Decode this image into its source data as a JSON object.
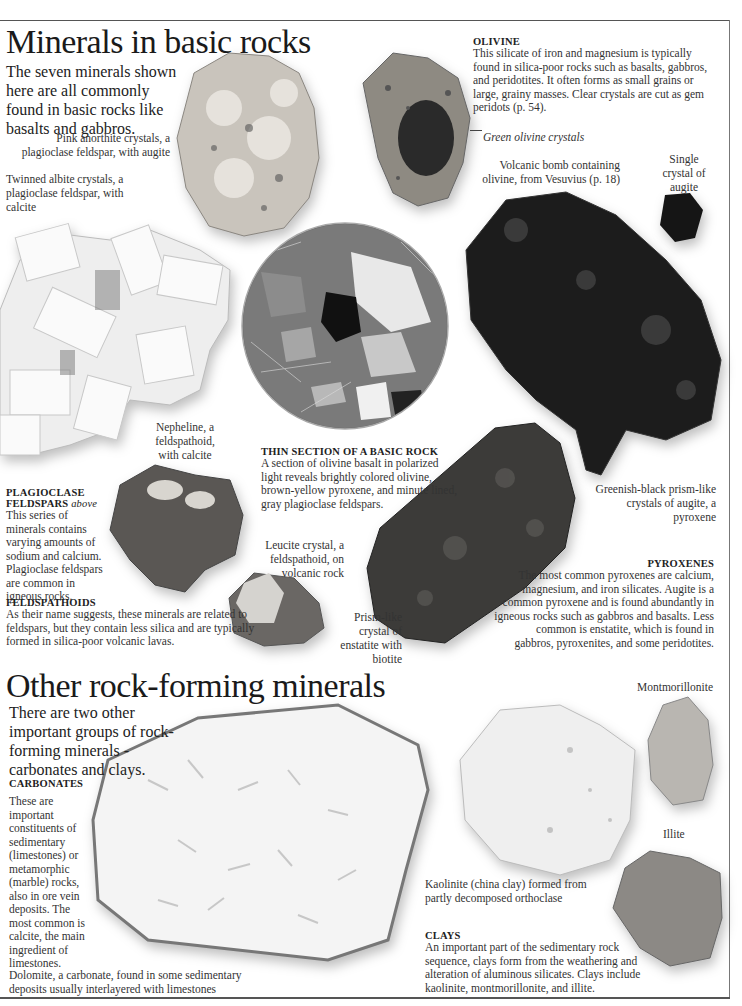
{
  "section1": {
    "title": "Minerals in basic rocks",
    "intro": "The seven minerals shown here are all commonly found in basic rocks like basalts and gabbros."
  },
  "captions": {
    "anorthite": "Pink anorthite crystals, a plagioclase feldspar, with augite",
    "albite": "Twinned albite crystals, a plagioclase feldspar, with calcite",
    "olivine_crystals": "Green olivine crystals",
    "volcanic_bomb": "Volcanic bomb containing olivine, from Vesuvius (p. 18)",
    "single_augite": "Single crystal of augite",
    "nepheline": "Nepheline, a feldspathoid, with calcite",
    "leucite": "Leucite crystal, a feldspathoid, on volcanic rock",
    "enstatite": "Prism-like crystal of enstatite with biotite",
    "augite_prisms": "Greenish-black prism-like crystals of augite, a pyroxene",
    "montmorillonite": "Montmorillonite",
    "illite": "Illite",
    "kaolinite": "Kaolinite (china clay) formed from partly decomposed orthoclase",
    "dolomite": "Dolomite, a carbonate, found in some sedimentary deposits usually interlayered with limestones"
  },
  "boxes": {
    "olivine": {
      "heading": "OLIVINE",
      "text": "This silicate of iron and magnesium is typically found in silica-poor rocks such as basalts, gabbros, and peridotites. It often forms as small grains or large, grainy masses. Clear crystals are cut as gem peridots (p. 54)."
    },
    "plagioclase": {
      "heading": "PLAGIOCLASE FELDSPARS",
      "heading_suffix": "above",
      "text": "This series of minerals contains varying amounts of sodium and calcium. Plagioclase feldspars are common in igneous rocks."
    },
    "thin_section": {
      "heading": "THIN SECTION OF A BASIC ROCK",
      "text": "A section of olivine basalt in polarized light reveals brightly colored olivine, brown-yellow pyroxene, and minute lined, gray plagioclase feldspars."
    },
    "feldspathoids": {
      "heading": "FELDSPATHOIDS",
      "text": "As their name suggests, these minerals are related to feldspars, but they contain less silica and are typically formed in silica-poor volcanic lavas."
    },
    "pyroxenes": {
      "heading": "PYROXENES",
      "text": "The most common pyroxenes are calcium, magnesium, and iron silicates. Augite is a common pyroxene and is found abundantly in igneous rocks such as gabbros and basalts. Less common is enstatite, which is found in gabbros, pyroxenites, and some peridotites."
    },
    "carbonates": {
      "heading": "CARBONATES",
      "text": "These are important constituents of sedimentary (limestones) or metamorphic (marble) rocks, also in ore vein deposits. The most common is calcite, the main ingredient of limestones."
    },
    "clays": {
      "heading": "CLAYS",
      "text": "An important part of the sedimentary rock sequence, clays form from the weathering and alteration of aluminous silicates. Clays include kaolinite, montmorillonite, and illite."
    }
  },
  "section2": {
    "title": "Other rock-forming minerals",
    "intro": "There are two other important groups of rock-forming minerals - carbonates and clays."
  }
}
